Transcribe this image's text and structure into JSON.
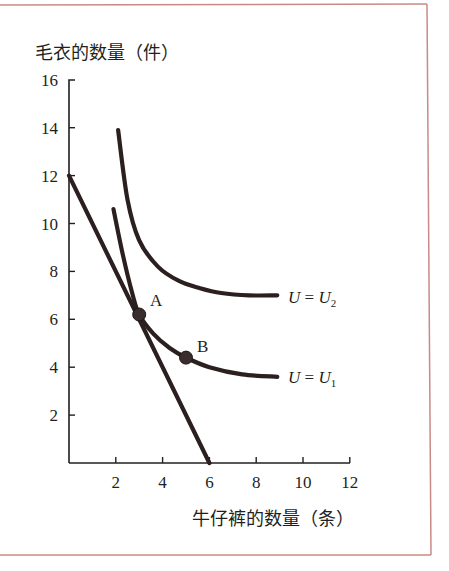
{
  "chart_data": {
    "type": "line",
    "title": "",
    "ylabel": "毛衣的数量（件）",
    "xlabel": "牛仔裤的数量（条）",
    "xlim": [
      0,
      12
    ],
    "ylim": [
      0,
      16
    ],
    "xticks": [
      2,
      4,
      6,
      8,
      10,
      12
    ],
    "yticks": [
      2,
      4,
      6,
      8,
      10,
      12,
      14,
      16
    ],
    "grid": false,
    "series": [
      {
        "name": "budget-line",
        "kind": "line",
        "x": [
          0,
          6
        ],
        "y": [
          12,
          0
        ]
      },
      {
        "name": "U = U2",
        "label": "U = U₂",
        "kind": "curve",
        "x": [
          2.1,
          2.5,
          3.0,
          3.8,
          4.7,
          5.6,
          6.5,
          7.7,
          8.9
        ],
        "y": [
          13.9,
          11.0,
          9.3,
          8.2,
          7.6,
          7.3,
          7.1,
          7.0,
          7.0
        ]
      },
      {
        "name": "U = U1",
        "label": "U = U₁",
        "kind": "curve",
        "x": [
          1.9,
          2.3,
          2.7,
          3.0,
          3.6,
          4.3,
          5.0,
          6.0,
          7.4,
          8.9
        ],
        "y": [
          10.6,
          8.7,
          7.1,
          6.2,
          5.4,
          4.8,
          4.4,
          4.0,
          3.7,
          3.6
        ]
      }
    ],
    "points": [
      {
        "label": "A",
        "x": 3.0,
        "y": 6.2
      },
      {
        "label": "B",
        "x": 5.0,
        "y": 4.4
      }
    ],
    "annotations": [
      {
        "text": "U = U₂",
        "x": 9.3,
        "y": 7.0
      },
      {
        "text": "U = U₁",
        "x": 9.3,
        "y": 3.6
      }
    ]
  },
  "labels": {
    "y_axis_title": "毛衣的数量（件）",
    "x_axis_title": "牛仔裤的数量（条）",
    "point_a": "A",
    "point_b": "B",
    "u2_U": "U",
    "u2_eq": " = ",
    "u2_U2": "U",
    "u2_sub": "2",
    "u1_U": "U",
    "u1_eq": " = ",
    "u1_U1": "U",
    "u1_sub": "1"
  },
  "colors": {
    "frame": "#c98a87",
    "ink": "#231f20",
    "curve": "#2b1f1f"
  }
}
